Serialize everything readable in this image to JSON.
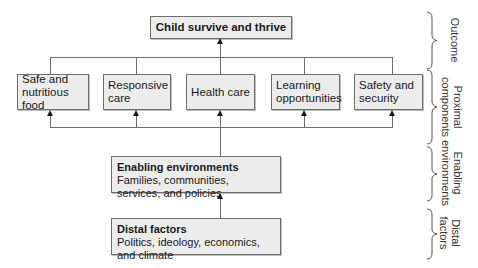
{
  "outcome": {
    "title": "Child survive and thrive"
  },
  "proximal": [
    {
      "label": "Safe and nutritious food"
    },
    {
      "label": "Responsive care"
    },
    {
      "label": "Health care"
    },
    {
      "label": "Learning opportunities"
    },
    {
      "label": "Safety and security"
    }
  ],
  "enabling": {
    "title": "Enabling environments",
    "subtitle": "Families, communities, services, and policies"
  },
  "distal": {
    "title": "Distal factors",
    "subtitle": "Politics, ideology, economics, and climate"
  },
  "levels": [
    {
      "label": "Outcome"
    },
    {
      "label": "Proximal components"
    },
    {
      "label": "Enabling environments"
    },
    {
      "label": "Distal factors"
    }
  ],
  "colors": {
    "box_fill": "#ececec",
    "box_border": "#6e6e6e",
    "line": "#6e6e6e"
  }
}
